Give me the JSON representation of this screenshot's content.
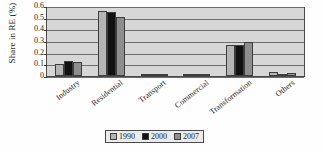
{
  "chart_data": {
    "type": "bar",
    "title": "",
    "xlabel": "",
    "ylabel": "Share in RE (%)",
    "ylim": [
      0,
      0.6
    ],
    "yticks": [
      "0.6",
      "0.5",
      "0.4",
      "0.3",
      "0.2",
      "0.1",
      "0"
    ],
    "ytick_values": [
      0.6,
      0.5,
      0.4,
      0.3,
      0.2,
      0.1,
      0
    ],
    "grid": true,
    "legend_position": "bottom-center",
    "categories": [
      "Industry",
      "Residential",
      "Transport",
      "Commercial",
      "Transformation",
      "Others"
    ],
    "series": [
      {
        "name": "1990",
        "color": "#b5b5b5",
        "values": [
          0.105,
          0.56,
          0.003,
          0.002,
          0.27,
          0.032
        ]
      },
      {
        "name": "2000",
        "color": "#111111",
        "values": [
          0.125,
          0.545,
          0.008,
          0.006,
          0.27,
          0.02
        ]
      },
      {
        "name": "2007",
        "color": "#8e8e8e",
        "values": [
          0.118,
          0.51,
          0.014,
          0.009,
          0.29,
          0.025
        ]
      }
    ]
  },
  "style": {
    "plot_background": "#d7d7d7",
    "axis_color": "#4a4a4a",
    "gridline_color": "#6d6d6d",
    "text_color": "#1c1c1c"
  }
}
